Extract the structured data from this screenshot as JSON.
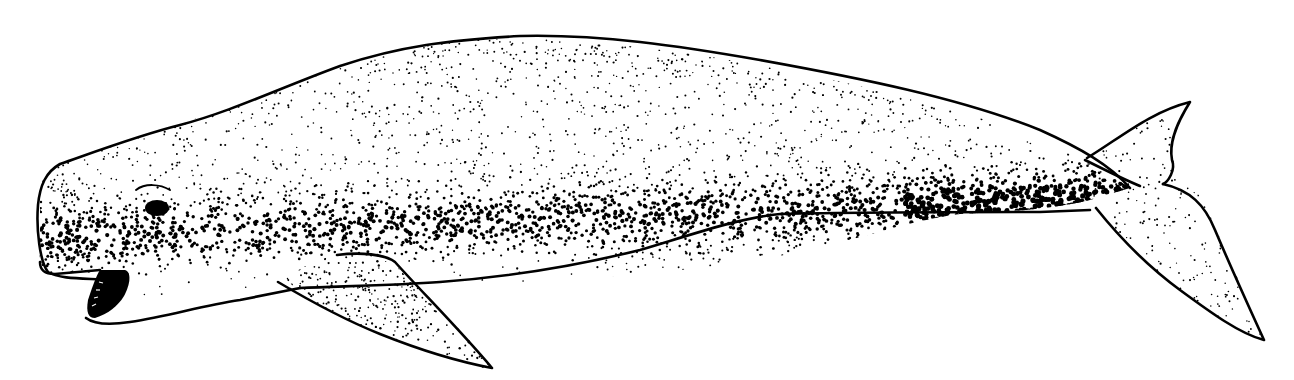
{
  "illustration": {
    "subject": "beluga-whale",
    "style": "stippled pen-and-ink line drawing",
    "ink_color": "#000000",
    "paper_color": "#ffffff",
    "parts": [
      "head",
      "eye",
      "open-mouth",
      "pectoral-flipper",
      "body",
      "tail-fluke"
    ]
  }
}
